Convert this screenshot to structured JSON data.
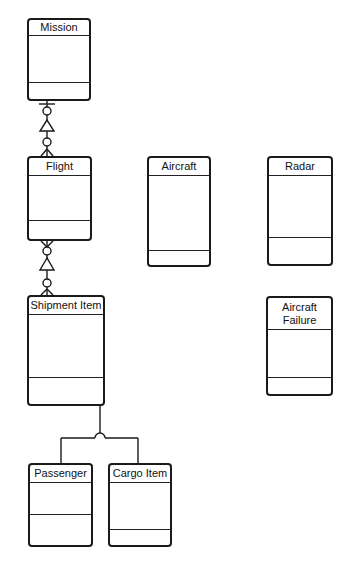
{
  "diagram": {
    "type": "entity-relationship",
    "entities": [
      {
        "id": "mission",
        "label": "Mission",
        "x": 27,
        "y": 18,
        "w": 64,
        "h": 83,
        "header_h": 16,
        "divider_y": 62
      },
      {
        "id": "flight",
        "label": "Flight",
        "x": 27,
        "y": 156,
        "w": 65,
        "h": 85,
        "header_h": 18,
        "divider_y": 62
      },
      {
        "id": "aircraft",
        "label": "Aircraft",
        "x": 147,
        "y": 156,
        "w": 64,
        "h": 111,
        "header_h": 18,
        "divider_y": 92
      },
      {
        "id": "radar",
        "label": "Radar",
        "x": 267,
        "y": 156,
        "w": 66,
        "h": 110,
        "header_h": 18,
        "divider_y": 79
      },
      {
        "id": "shipment-item",
        "label": "Shipment Item",
        "x": 27,
        "y": 295,
        "w": 78,
        "h": 111,
        "header_h": 18,
        "divider_y": 80
      },
      {
        "id": "aircraft-failure",
        "label": "Aircraft\nFailure",
        "x": 266,
        "y": 296,
        "w": 67,
        "h": 100,
        "header_h": 32,
        "divider_y": 79
      },
      {
        "id": "passenger",
        "label": "Passenger",
        "x": 28,
        "y": 463,
        "w": 65,
        "h": 84,
        "header_h": 18,
        "divider_y": 49
      },
      {
        "id": "cargo-item",
        "label": "Cargo Item",
        "x": 108,
        "y": 463,
        "w": 64,
        "h": 84,
        "header_h": 18,
        "divider_y": 64
      }
    ],
    "relationships": [
      {
        "from": "mission",
        "to": "flight",
        "from_cardinality": "exactly-one-or-zero",
        "to_cardinality": "zero-or-many",
        "symbol": "triangle"
      },
      {
        "from": "flight",
        "to": "shipment-item",
        "from_cardinality": "zero-or-many",
        "to_cardinality": "zero-or-many",
        "symbol": "triangle"
      }
    ],
    "generalization": {
      "parent": "shipment-item",
      "children": [
        "passenger",
        "cargo-item"
      ]
    }
  },
  "colors": {
    "line": "#1a1a1a",
    "background": "#ffffff"
  }
}
